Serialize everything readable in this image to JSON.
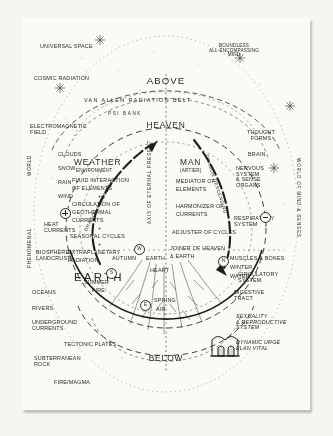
{
  "diagram": {
    "title_above": "ABOVE",
    "title_below": "BELOW",
    "title_heaven": "HEAVEN",
    "title_earth": "EARTH",
    "axis_label": "AXIS OF ETERNAL PRESENT",
    "dragon_ascending": "DRAGON ASCENDING",
    "dragon_descending": "DRAGON DESCENDING",
    "left_edge_world": "WORLD",
    "left_edge_phenomenal": "PHENOMENAL",
    "right_edge": "WORLD OF MIND & SENSES"
  },
  "top": {
    "universal_space": "UNIVERSAL SPACE",
    "cosmic_radiation": "COSMIC RADIATION",
    "boundless_mind": "BOUNDLESS\nALL-ENCOMPASSING\nMIND",
    "van_allen": "VAN ALLEN RADIATION BELT",
    "psi_bank": "PSI BANK",
    "electromagnetic_field": "ELECTROMAGNETIC\nFIELD",
    "thought_forms": "THOUGHT\nFORMS"
  },
  "left_column": {
    "items": [
      "CLOUDS",
      "SNOW",
      "RAIN",
      "WIND",
      "HEAT\nCURRENTS",
      "BIOSPHERE\nLANDCRUST",
      "OCEANS",
      "RIVERS",
      "UNDERGROUND\nCURRENTS",
      "TECTONIC PLATES",
      "SUBTERRANEAN\nROCK",
      "FIRE/MAGMA"
    ]
  },
  "weather_block": {
    "title": "WEATHER",
    "subtitle": "ENVIRONMENT",
    "lines": [
      "FLUID INTERACTION",
      "OF ELEMENTS",
      "+",
      "CIRCULATION OF",
      "GEOTHERMAL",
      "CURRENTS",
      "+",
      "SEASONAL CYCLES",
      "+",
      "EXTRAPLANETARY",
      "RADIATION"
    ]
  },
  "man_block": {
    "title": "MAN",
    "subtitle": "(ARTIER)",
    "lines": [
      "MEDIATOR OF",
      "ELEMENTS",
      "HARMONIZER OF",
      "CURRENTS",
      "ADJUSTER OF CYCLES",
      "JOINER OF HEAVEN",
      "& EARTH"
    ]
  },
  "right_column": {
    "items": [
      "BRAIN",
      "NERVOUS\nSYSTEM\n& SENSE\nORGANS",
      "RESPIRATORY\nSYSTEM",
      "CIRCULATORY\nSYSTEM",
      "DIGESTIVE\nTRACT",
      "SEXUALITY\n& REPRODUCTIVE\nSYSTEM",
      "DYNAMIC URGE\nELAN VITAL"
    ]
  },
  "compass": {
    "north": {
      "letter": "N",
      "season": "WINTER",
      "element": "WATER",
      "body": "MUSCLES & BONES"
    },
    "south": {
      "letter": "S",
      "season": "SUMMER",
      "element": "FIRE"
    },
    "east": {
      "letter": "E",
      "season": "SPRING",
      "element": "AIR"
    },
    "west": {
      "letter": "W",
      "season": "AUTUMN",
      "element": "EARTH",
      "body": "HEART"
    }
  },
  "polarity": {
    "positive": "+",
    "negative": "-"
  },
  "colors": {
    "ink": "#2a2724",
    "paper": "#fbfaf7",
    "page": "#f7f5f1"
  }
}
